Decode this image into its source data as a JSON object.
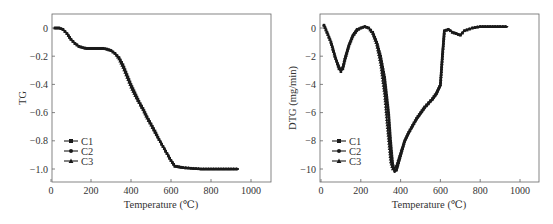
{
  "chart_data": [
    {
      "id": "tg",
      "type": "line",
      "title": "",
      "xlabel": "Temperature (℃)",
      "ylabel": "TG",
      "xlim": [
        0,
        1100
      ],
      "ylim": [
        -1.1,
        0.1
      ],
      "xticks": [
        0,
        200,
        400,
        600,
        800,
        1000
      ],
      "xtick_labels": [
        "0",
        "200",
        "400",
        "600",
        "800",
        "1000"
      ],
      "yticks": [
        0,
        -0.2,
        -0.4,
        -0.6,
        -0.8,
        -1.0
      ],
      "ytick_labels": [
        "0",
        "−0.2",
        "−0.4",
        "−0.6",
        "−0.8",
        "−1.0"
      ],
      "grid": false,
      "legend_position": "lower left",
      "series": [
        {
          "name": "C1",
          "marker": "square",
          "x": [
            20,
            40,
            60,
            80,
            100,
            120,
            140,
            160,
            180,
            200,
            220,
            240,
            260,
            280,
            300,
            320,
            340,
            360,
            380,
            400,
            420,
            440,
            460,
            480,
            500,
            520,
            540,
            560,
            580,
            600,
            620,
            640,
            660,
            700,
            750,
            800,
            850,
            900,
            940
          ],
          "y": [
            0,
            0,
            -0.01,
            -0.04,
            -0.08,
            -0.11,
            -0.13,
            -0.14,
            -0.145,
            -0.145,
            -0.145,
            -0.145,
            -0.145,
            -0.15,
            -0.16,
            -0.18,
            -0.21,
            -0.26,
            -0.33,
            -0.4,
            -0.46,
            -0.52,
            -0.57,
            -0.63,
            -0.68,
            -0.73,
            -0.79,
            -0.84,
            -0.89,
            -0.94,
            -0.98,
            -0.985,
            -0.99,
            -0.995,
            -1.0,
            -1.0,
            -1.0,
            -1.0,
            -1.0
          ]
        },
        {
          "name": "C2",
          "marker": "circle",
          "x": [
            20,
            40,
            60,
            80,
            100,
            120,
            140,
            160,
            180,
            200,
            220,
            240,
            260,
            280,
            300,
            320,
            340,
            360,
            380,
            400,
            420,
            440,
            460,
            480,
            500,
            520,
            540,
            560,
            580,
            600,
            620,
            640,
            660,
            700,
            750,
            800,
            850,
            900,
            940
          ],
          "y": [
            0,
            0,
            -0.01,
            -0.04,
            -0.08,
            -0.11,
            -0.13,
            -0.14,
            -0.145,
            -0.145,
            -0.145,
            -0.145,
            -0.145,
            -0.15,
            -0.16,
            -0.18,
            -0.21,
            -0.27,
            -0.34,
            -0.41,
            -0.47,
            -0.53,
            -0.58,
            -0.63,
            -0.68,
            -0.74,
            -0.79,
            -0.84,
            -0.89,
            -0.94,
            -0.98,
            -0.985,
            -0.99,
            -0.995,
            -1.0,
            -1.0,
            -1.0,
            -1.0,
            -1.0
          ]
        },
        {
          "name": "C3",
          "marker": "triangle",
          "x": [
            20,
            40,
            60,
            80,
            100,
            120,
            140,
            160,
            180,
            200,
            220,
            240,
            260,
            280,
            300,
            320,
            340,
            360,
            380,
            400,
            420,
            440,
            460,
            480,
            500,
            520,
            540,
            560,
            580,
            600,
            620,
            640,
            660,
            700,
            750,
            800,
            850,
            900,
            940
          ],
          "y": [
            0,
            0,
            -0.01,
            -0.04,
            -0.08,
            -0.11,
            -0.13,
            -0.14,
            -0.145,
            -0.145,
            -0.145,
            -0.145,
            -0.145,
            -0.15,
            -0.16,
            -0.18,
            -0.22,
            -0.28,
            -0.35,
            -0.42,
            -0.48,
            -0.53,
            -0.58,
            -0.64,
            -0.69,
            -0.74,
            -0.79,
            -0.84,
            -0.89,
            -0.94,
            -0.98,
            -0.985,
            -0.99,
            -0.995,
            -1.0,
            -1.0,
            -1.0,
            -1.0,
            -1.0
          ]
        }
      ]
    },
    {
      "id": "dtg",
      "type": "line",
      "title": "",
      "xlabel": "Temperature (℃)",
      "ylabel": "DTG (mg/min)",
      "xlim": [
        0,
        1100
      ],
      "ylim": [
        -11,
        1
      ],
      "xticks": [
        0,
        200,
        400,
        600,
        800,
        1000
      ],
      "xtick_labels": [
        "0",
        "200",
        "400",
        "600",
        "800",
        "1000"
      ],
      "yticks": [
        0,
        -2,
        -4,
        -6,
        -8,
        -10
      ],
      "ytick_labels": [
        "0",
        "−2",
        "−4",
        "−6",
        "−8",
        "−10"
      ],
      "grid": false,
      "legend_position": "lower left",
      "series": [
        {
          "name": "C1",
          "marker": "square",
          "x": [
            15,
            30,
            50,
            70,
            90,
            100,
            110,
            120,
            140,
            160,
            180,
            200,
            220,
            240,
            260,
            280,
            300,
            320,
            340,
            350,
            360,
            370,
            380,
            400,
            420,
            440,
            460,
            480,
            500,
            520,
            540,
            560,
            580,
            600,
            610,
            620,
            640,
            660,
            680,
            700,
            720,
            760,
            800,
            850,
            900,
            940
          ],
          "y": [
            0.2,
            -0.3,
            -1.0,
            -2.0,
            -2.9,
            -3.1,
            -2.9,
            -2.3,
            -1.3,
            -0.6,
            -0.2,
            0,
            0.1,
            0,
            -0.3,
            -1.0,
            -2.0,
            -3.5,
            -6.0,
            -8.0,
            -9.6,
            -10.1,
            -10.0,
            -9.0,
            -8.0,
            -7.4,
            -6.9,
            -6.4,
            -6.0,
            -5.6,
            -5.3,
            -5.0,
            -4.6,
            -4.0,
            -2.0,
            -0.2,
            -0.1,
            -0.3,
            -0.4,
            -0.5,
            -0.2,
            0,
            0.1,
            0.1,
            0.1,
            0.1
          ]
        },
        {
          "name": "C2",
          "marker": "circle",
          "x": [
            15,
            30,
            50,
            70,
            90,
            100,
            110,
            120,
            140,
            160,
            180,
            200,
            220,
            240,
            260,
            280,
            300,
            320,
            340,
            350,
            360,
            370,
            380,
            400,
            420,
            440,
            460,
            480,
            500,
            520,
            540,
            560,
            580,
            600,
            610,
            620,
            640,
            660,
            680,
            700,
            720,
            760,
            800,
            850,
            900,
            940
          ],
          "y": [
            0.2,
            -0.3,
            -1.0,
            -2.0,
            -2.8,
            -3.0,
            -2.8,
            -2.2,
            -1.2,
            -0.5,
            -0.1,
            0,
            0.1,
            0,
            -0.3,
            -1.0,
            -2.2,
            -3.8,
            -6.5,
            -8.5,
            -9.8,
            -10.2,
            -10.1,
            -9.1,
            -8.1,
            -7.5,
            -7.0,
            -6.5,
            -6.1,
            -5.7,
            -5.4,
            -5.1,
            -4.7,
            -4.1,
            -2.0,
            -0.2,
            -0.1,
            -0.3,
            -0.4,
            -0.5,
            -0.2,
            0,
            0.1,
            0.1,
            0.1,
            0.1
          ]
        },
        {
          "name": "C3",
          "marker": "triangle",
          "x": [
            15,
            30,
            50,
            70,
            90,
            100,
            110,
            120,
            140,
            160,
            180,
            200,
            220,
            240,
            260,
            280,
            300,
            320,
            330,
            340,
            350,
            360,
            370,
            380,
            400,
            420,
            440,
            460,
            480,
            500,
            520,
            540,
            560,
            580,
            600,
            610,
            620,
            640,
            660,
            680,
            700,
            720,
            760,
            800,
            850,
            900,
            940
          ],
          "y": [
            0.2,
            -0.3,
            -1.0,
            -2.0,
            -2.7,
            -2.9,
            -2.7,
            -2.1,
            -1.2,
            -0.5,
            -0.1,
            0,
            0.1,
            0,
            -0.4,
            -1.2,
            -2.6,
            -4.8,
            -6.5,
            -8.0,
            -9.5,
            -10.0,
            -10.0,
            -9.7,
            -8.8,
            -8.0,
            -7.4,
            -6.9,
            -6.4,
            -6.0,
            -5.6,
            -5.3,
            -5.0,
            -4.6,
            -4.0,
            -2.0,
            -0.2,
            -0.1,
            -0.3,
            -0.4,
            -0.5,
            -0.2,
            0,
            0.1,
            0.1,
            0.1,
            0.1
          ]
        }
      ]
    }
  ],
  "panels": {
    "tg": {
      "ylabel": "TG",
      "xlabel": "Temperature (℃)",
      "legend": [
        "C1",
        "C2",
        "C3"
      ]
    },
    "dtg": {
      "ylabel": "DTG (mg/min)",
      "xlabel": "Temperature (℃)",
      "legend": [
        "C1",
        "C2",
        "C3"
      ]
    }
  },
  "colors": {
    "line": "#1a1a1a",
    "axis": "#555555",
    "background": "#ffffff"
  }
}
